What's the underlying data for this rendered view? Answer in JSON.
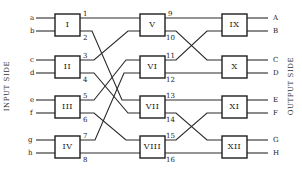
{
  "diagram": {
    "type": "three-stage switching network",
    "side_labels": {
      "input": "INPUT SIDE",
      "output": "OUTPUT SIDE"
    },
    "inputs": [
      "a",
      "b",
      "c",
      "d",
      "e",
      "f",
      "g",
      "h"
    ],
    "outputs": [
      "A",
      "B",
      "C",
      "D",
      "E",
      "F",
      "G",
      "H"
    ],
    "stages": [
      {
        "name": "stage-1",
        "boxes": [
          "I",
          "II",
          "III",
          "IV"
        ]
      },
      {
        "name": "stage-2",
        "boxes": [
          "V",
          "VI",
          "VII",
          "VIII"
        ]
      },
      {
        "name": "stage-3",
        "boxes": [
          "IX",
          "X",
          "XI",
          "XII"
        ]
      }
    ],
    "link_numbers_stage1": [
      "1",
      "2",
      "3",
      "4",
      "5",
      "6",
      "7",
      "8"
    ],
    "link_numbers_stage2": [
      "9",
      "10",
      "11",
      "12",
      "13",
      "14",
      "15",
      "16"
    ],
    "connections_stage1_to_stage2": [
      {
        "from": "1",
        "to": "V"
      },
      {
        "from": "3",
        "to": "V"
      },
      {
        "from": "5",
        "to": "VI"
      },
      {
        "from": "7",
        "to": "VI"
      },
      {
        "from": "2",
        "to": "VII"
      },
      {
        "from": "4",
        "to": "VII"
      },
      {
        "from": "6",
        "to": "VIII"
      },
      {
        "from": "8",
        "to": "VIII"
      }
    ],
    "connections_stage2_to_stage3": [
      {
        "from": "9",
        "to": "IX"
      },
      {
        "from": "10",
        "to": "X"
      },
      {
        "from": "11",
        "to": "IX"
      },
      {
        "from": "12",
        "to": "X"
      },
      {
        "from": "13",
        "to": "XI"
      },
      {
        "from": "14",
        "to": "XII"
      },
      {
        "from": "15",
        "to": "XI"
      },
      {
        "from": "16",
        "to": "XII"
      }
    ]
  }
}
